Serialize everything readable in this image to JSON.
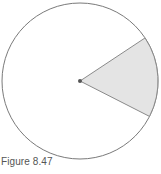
{
  "figure": {
    "caption": "Figure 8.47",
    "circle": {
      "cx": 80,
      "cy": 81,
      "r": 78,
      "stroke": "#7a7a7a",
      "fill": "#ffffff"
    },
    "sector": {
      "start_angle_deg": -33.5,
      "end_angle_deg": 27,
      "fill": "#e4e4e4",
      "stroke": "#8a8a8a"
    },
    "center_point": {
      "color": "#555555",
      "r": 2
    }
  }
}
